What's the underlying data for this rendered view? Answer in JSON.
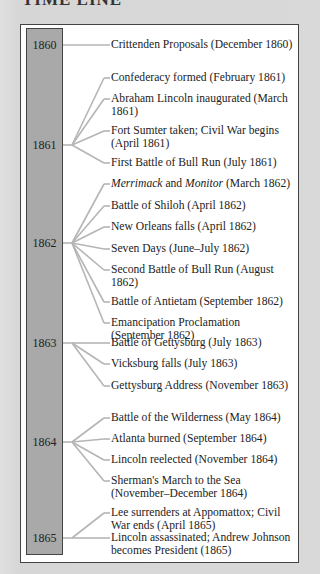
{
  "title": "TIME LINE",
  "colors": {
    "frame_border": "#444444",
    "year_bar": "#a9a9a9",
    "connector": "#b5b5b5",
    "background": "#d9d9d9"
  },
  "years": [
    {
      "label": "1860",
      "y": 45
    },
    {
      "label": "1861",
      "y": 145
    },
    {
      "label": "1862",
      "y": 243
    },
    {
      "label": "1863",
      "y": 343
    },
    {
      "label": "1864",
      "y": 442
    },
    {
      "label": "1865",
      "y": 538
    }
  ],
  "events": [
    {
      "year": 0,
      "y": 45,
      "text": "Crittenden Proposals (December 1860)"
    },
    {
      "year": 1,
      "y": 78,
      "text": "Confederacy formed (February 1861)"
    },
    {
      "year": 1,
      "y": 99,
      "text": "Abraham Lincoln inaugurated (March 1861)"
    },
    {
      "year": 1,
      "y": 131,
      "text": "Fort Sumter taken; Civil War begins (April 1861)"
    },
    {
      "year": 1,
      "y": 163,
      "text": "First Battle of Bull Run (July 1861)"
    },
    {
      "year": 2,
      "y": 184,
      "text": "Merrimack and Monitor (March 1862)",
      "italic": [
        "Merrimack",
        "Monitor"
      ]
    },
    {
      "year": 2,
      "y": 206,
      "text": "Battle of Shiloh (April 1862)"
    },
    {
      "year": 2,
      "y": 227,
      "text": "New Orleans falls (April 1862)"
    },
    {
      "year": 2,
      "y": 249,
      "text": "Seven Days (June–July 1862)"
    },
    {
      "year": 2,
      "y": 270,
      "text": "Second Battle of Bull Run (August 1862)"
    },
    {
      "year": 2,
      "y": 302,
      "text": "Battle of Antietam (September 1862)"
    },
    {
      "year": 2,
      "y": 323,
      "text": "Emancipation Proclamation (September 1862)"
    },
    {
      "year": 3,
      "y": 343,
      "text": "Battle of Gettysburg (July 1863)"
    },
    {
      "year": 3,
      "y": 364,
      "text": "Vicksburg falls (July 1863)"
    },
    {
      "year": 3,
      "y": 386,
      "text": "Gettysburg Address (November 1863)"
    },
    {
      "year": 4,
      "y": 418,
      "text": "Battle of the Wilderness (May 1864)"
    },
    {
      "year": 4,
      "y": 439,
      "text": "Atlanta burned (September 1864)"
    },
    {
      "year": 4,
      "y": 460,
      "text": "Lincoln reelected (November 1864)"
    },
    {
      "year": 4,
      "y": 481,
      "text": "Sherman's March to the Sea (November–December 1864)"
    },
    {
      "year": 5,
      "y": 513,
      "text": "Lee surrenders at Appomattox; Civil War ends (April 1865)"
    },
    {
      "year": 5,
      "y": 538,
      "text": "Lincoln assassinated; Andrew Johnson becomes President (1865)"
    }
  ]
}
